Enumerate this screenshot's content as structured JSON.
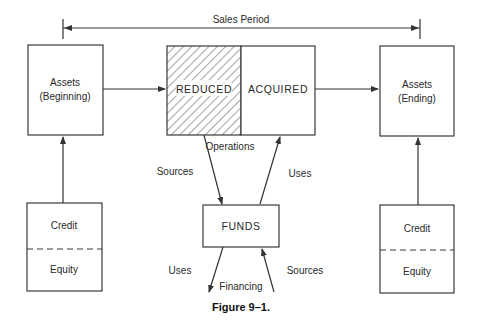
{
  "period": {
    "label": "Sales Period"
  },
  "boxes": {
    "assets_beginning": {
      "line1": "Assets",
      "line2": "(Beginning)"
    },
    "reduced": {
      "label": "REDUCED"
    },
    "acquired": {
      "label": "ACQUIRED"
    },
    "assets_ending": {
      "line1": "Assets",
      "line2": "(Ending)"
    },
    "funds": {
      "label": "FUNDS"
    },
    "left_claims": {
      "top": "Credit",
      "bottom": "Equity"
    },
    "right_claims": {
      "top": "Credit",
      "bottom": "Equity"
    }
  },
  "flows": {
    "operations": "Operations",
    "operations_sources": "Sources",
    "operations_uses": "Uses",
    "financing": "Financing",
    "financing_uses": "Uses",
    "financing_sources": "Sources"
  },
  "caption": "Figure 9–1.",
  "colors": {
    "line": "#333333",
    "text": "#2a2a2a",
    "background": "#ffffff"
  }
}
